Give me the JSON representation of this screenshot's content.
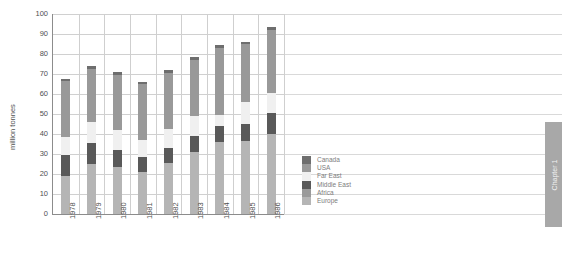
{
  "chart_data": {
    "type": "bar",
    "subtype": "stacked-bar",
    "title": "",
    "xlabel": "",
    "ylabel": "million tonnes",
    "ylim": [
      0,
      100
    ],
    "yticks": [
      0,
      10,
      20,
      30,
      40,
      50,
      60,
      70,
      80,
      90,
      100
    ],
    "grid": true,
    "legend_position": "center-right",
    "categories": [
      "1978",
      "1979",
      "1980",
      "1981",
      "1982",
      "1983",
      "1984",
      "1985",
      "1986"
    ],
    "series": [
      {
        "name": "Europe",
        "color": "#b5b5b5",
        "values": [
          19.0,
          25.0,
          23.5,
          21.0,
          25.5,
          31.0,
          36.0,
          36.5,
          40.0
        ]
      },
      {
        "name": "Africa",
        "color": "#9a9a9a",
        "values": [
          0.0,
          0.0,
          0.0,
          0.0,
          0.0,
          0.0,
          0.0,
          0.0,
          0.0
        ]
      },
      {
        "name": "Middle East",
        "color": "#595959",
        "values": [
          10.5,
          10.5,
          8.5,
          7.5,
          7.5,
          8.0,
          8.0,
          8.5,
          10.5
        ]
      },
      {
        "name": "Far East",
        "color": "#f0f0f0",
        "values": [
          9.0,
          10.5,
          10.0,
          8.5,
          9.5,
          10.0,
          5.5,
          11.0,
          10.0
        ]
      },
      {
        "name": "USA",
        "color": "#999999",
        "values": [
          28.0,
          26.5,
          27.5,
          28.0,
          28.0,
          28.0,
          33.5,
          29.0,
          31.5
        ]
      },
      {
        "name": "Canada",
        "color": "#6e6e6e",
        "values": [
          1.0,
          1.5,
          1.5,
          1.0,
          1.5,
          1.5,
          1.5,
          1.0,
          1.5
        ]
      }
    ],
    "totals": [
      67.5,
      74.0,
      71.0,
      66.0,
      72.0,
      78.5,
      84.5,
      86.0,
      93.5
    ]
  },
  "legend": {
    "items": [
      {
        "label": "Canada",
        "color": "#6e6e6e"
      },
      {
        "label": "USA",
        "color": "#999999"
      },
      {
        "label": "Far East",
        "color": "#f0f0f0"
      },
      {
        "label": "Middle East",
        "color": "#595959"
      },
      {
        "label": "Africa",
        "color": "#9a9a9a"
      },
      {
        "label": "Europe",
        "color": "#b5b5b5"
      }
    ]
  },
  "chapter_tab": {
    "label": "Chapter 1",
    "color": "#a8a8a8"
  },
  "colors": {
    "axis": "#8c8c8c",
    "grid": "#d9d9d9",
    "text": "#4f4f4f",
    "legend_text": "#7d7d7d"
  }
}
